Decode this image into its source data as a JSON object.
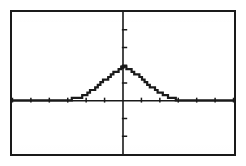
{
  "document": {
    "kind": "graphing-calculator-screen-figure",
    "caption": ""
  },
  "screen": {
    "frame_color": "#1a1a1a",
    "background_color": "#ffffff",
    "trace_color": "#1a1a1a",
    "axis_color": "#1a1a1a",
    "border_width_px": 2
  },
  "chart_data": {
    "type": "line",
    "title": "",
    "subtitle": "",
    "xlabel": "",
    "ylabel": "",
    "legend": [],
    "legend_position": "none",
    "grid": false,
    "axes": {
      "x_axis_visible": true,
      "y_axis_visible": true,
      "x_axis_at_y": 0,
      "y_axis_at_x": 0,
      "xlim": [
        -4.7,
        4.7
      ],
      "ylim": [
        -1.2,
        2.0
      ],
      "xscl": 0.78,
      "yscl": 0.4,
      "x_tick_count_left": 6,
      "x_tick_count_right": 6,
      "y_tick_count_above": 4,
      "y_tick_count_below": 3,
      "tick_length_px": 4
    },
    "annotations": [
      {
        "name": "peak-marker",
        "x": 0,
        "y": 1.0,
        "style": "filled-dot"
      }
    ],
    "series": [
      {
        "name": "bell-curve",
        "style": "stair-stepped-pixel-plot",
        "x": [
          -4.7,
          -4.4,
          -4.1,
          -3.8,
          -3.5,
          -3.2,
          -2.9,
          -2.6,
          -2.3,
          -2.1,
          -1.9,
          -1.7,
          -1.5,
          -1.35,
          -1.2,
          -1.05,
          -0.9,
          -0.75,
          -0.6,
          -0.45,
          -0.3,
          -0.15,
          0.0,
          0.15,
          0.3,
          0.45,
          0.6,
          0.75,
          0.9,
          1.05,
          1.2,
          1.35,
          1.5,
          1.7,
          1.9,
          2.1,
          2.3,
          2.6,
          2.9,
          3.2,
          3.5,
          3.8,
          4.1,
          4.4,
          4.7
        ],
        "y": [
          0.0,
          0.0,
          0.0,
          0.0,
          0.001,
          0.002,
          0.005,
          0.013,
          0.029,
          0.05,
          0.08,
          0.123,
          0.181,
          0.234,
          0.294,
          0.36,
          0.428,
          0.496,
          0.562,
          0.623,
          0.679,
          0.726,
          0.76,
          0.726,
          0.679,
          0.623,
          0.562,
          0.496,
          0.428,
          0.36,
          0.294,
          0.234,
          0.181,
          0.123,
          0.08,
          0.05,
          0.029,
          0.013,
          0.005,
          0.002,
          0.001,
          0.0,
          0.0,
          0.0,
          0.0
        ],
        "description": "symmetric bell-shaped normal distribution curve centered on the y-axis with peak touching the top tick region"
      }
    ]
  }
}
